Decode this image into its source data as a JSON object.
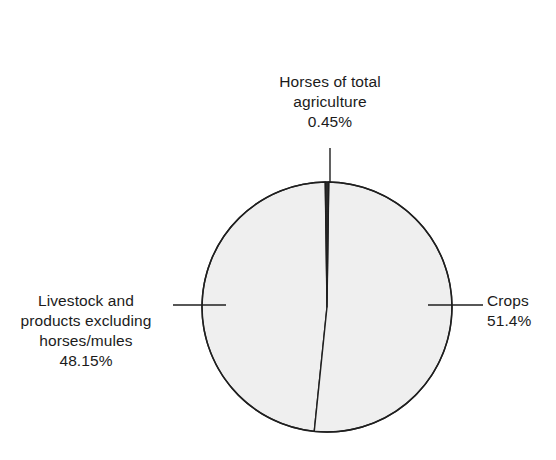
{
  "chart_data": {
    "type": "pie",
    "title": "",
    "subtitle": "",
    "xlabel": "",
    "ylabel": "",
    "grid": false,
    "legend_position": "none",
    "labels_position": "outside-with-leader-lines",
    "total_percent": "100%",
    "categories": [
      "Horses of total agriculture",
      "Crops",
      "Livestock and products excluding horses/mules"
    ],
    "values": [
      0.45,
      51.4,
      48.15
    ],
    "value_labels": [
      "0.45%",
      "51.4%",
      "48.15%"
    ],
    "slices": [
      {
        "name": "horses-of-total-agriculture",
        "label_lines": [
          "Horses of total",
          "agriculture"
        ],
        "value": 0.45,
        "value_label": "0.45%",
        "fill": "#efefef",
        "stroke": "#1f1f1f",
        "leader": "top"
      },
      {
        "name": "crops",
        "label_lines": [
          "Crops"
        ],
        "value": 51.4,
        "value_label": "51.4%",
        "fill": "#efefef",
        "stroke": "#1f1f1f",
        "leader": "right"
      },
      {
        "name": "livestock-and-products-excluding-horses-mules",
        "label_lines": [
          "Livestock and",
          "products excluding",
          "horses/mules"
        ],
        "value": 48.15,
        "value_label": "48.15%",
        "fill": "#efefef",
        "stroke": "#1f1f1f",
        "leader": "left"
      }
    ]
  },
  "labels": {
    "horses": {
      "line1": "Horses of total",
      "line2": "agriculture",
      "percent": "0.45%"
    },
    "livestock": {
      "line1": "Livestock and",
      "line2": "products excluding",
      "line3": "horses/mules",
      "percent": "48.15%"
    },
    "crops": {
      "line1": "Crops",
      "percent": "51.4%"
    }
  },
  "colors": {
    "background": "#ffffff",
    "slice_fill": "#efefef",
    "outline": "#1f1f1f",
    "text": "#1b1b1b",
    "leader_line": "#1f1f1f"
  },
  "geometry": {
    "center_x": 327,
    "center_y": 307,
    "radius": 125
  }
}
